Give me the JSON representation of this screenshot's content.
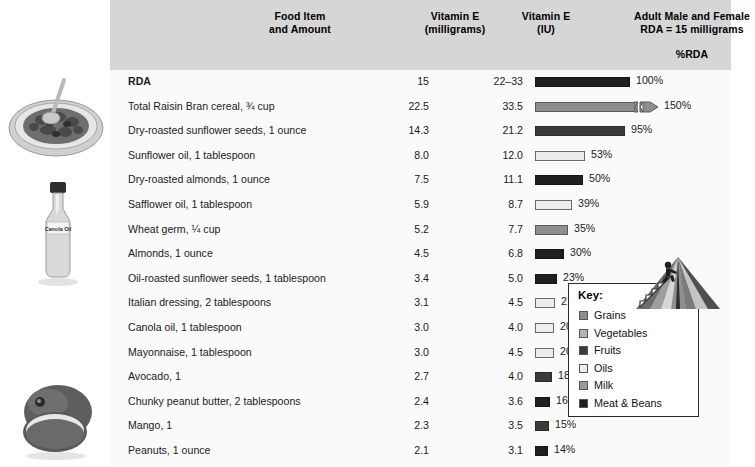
{
  "header": {
    "col_food_l1": "Food Item",
    "col_food_l2": "and Amount",
    "col_mg_l1": "Vitamin E",
    "col_mg_l2": "(milligrams)",
    "col_iu_l1": "Vitamin E",
    "col_iu_l2": "(IU)",
    "col_rda_l1": "Adult Male and Female",
    "col_rda_l2": "RDA = 15 milligrams",
    "col_pct": "%RDA"
  },
  "key": {
    "title": "Key:",
    "items": [
      {
        "label": "Grains",
        "color": "#8e8e8e"
      },
      {
        "label": "Vegetables",
        "color": "#b5b5b5"
      },
      {
        "label": "Fruits",
        "color": "#3a3a3a"
      },
      {
        "label": "Oils",
        "color": "#ededed"
      },
      {
        "label": "Milk",
        "color": "#9a9a9a"
      },
      {
        "label": "Meat & Beans",
        "color": "#1f1f1f"
      }
    ]
  },
  "illustrations": [
    {
      "name": "raisin-bran-cereal-bowl"
    },
    {
      "name": "canola-oil-bottle",
      "label": "Canola Oil"
    },
    {
      "name": "mango-fruit"
    }
  ],
  "chart_data": {
    "type": "bar",
    "title": "Adult Male and Female RDA = 15 milligrams",
    "xlabel": "%RDA",
    "ylabel": "Food Item and Amount",
    "xlim": [
      0,
      150
    ],
    "grid": false,
    "columns": [
      "Food Item and Amount",
      "Vitamin E (milligrams)",
      "Vitamin E (IU)",
      "%RDA"
    ],
    "categories": [
      "RDA",
      "Total Raisin Bran cereal, ¾ cup",
      "Dry-roasted sunflower seeds, 1 ounce",
      "Sunflower oil, 1 tablespoon",
      "Dry-roasted almonds, 1 ounce",
      "Safflower oil, 1 tablespoon",
      "Wheat germ, ¼ cup",
      "Almonds, 1 ounce",
      "Oil-roasted sunflower seeds, 1 tablespoon",
      "Italian dressing, 2 tablespoons",
      "Canola oil, 1 tablespoon",
      "Mayonnaise, 1 tablespoon",
      "Avocado, 1",
      "Chunky peanut butter, 2 tablespoons",
      "Mango, 1",
      "Peanuts, 1 ounce"
    ],
    "values": [
      100,
      150,
      95,
      53,
      50,
      39,
      35,
      30,
      23,
      21,
      20,
      20,
      18,
      16,
      15,
      14
    ],
    "rows": [
      {
        "name": "RDA",
        "mg": "15",
        "iu": "22–33",
        "pct_value": 100,
        "pct_label": "100%",
        "group": "meat",
        "bold": true,
        "broken": false
      },
      {
        "name": "Total Raisin Bran cereal, ¾ cup",
        "mg": "22.5",
        "iu": "33.5",
        "pct_value": 150,
        "pct_label": "150%",
        "group": "grains",
        "bold": false,
        "broken": true
      },
      {
        "name": "Dry-roasted sunflower seeds, 1 ounce",
        "mg": "14.3",
        "iu": "21.2",
        "pct_value": 95,
        "pct_label": "95%",
        "group": "fruits",
        "bold": false,
        "broken": false
      },
      {
        "name": "Sunflower oil, 1 tablespoon",
        "mg": "8.0",
        "iu": "12.0",
        "pct_value": 53,
        "pct_label": "53%",
        "group": "oils",
        "bold": false,
        "broken": false
      },
      {
        "name": "Dry-roasted almonds, 1 ounce",
        "mg": "7.5",
        "iu": "11.1",
        "pct_value": 50,
        "pct_label": "50%",
        "group": "meat",
        "bold": false,
        "broken": false
      },
      {
        "name": "Safflower oil, 1 tablespoon",
        "mg": "5.9",
        "iu": "8.7",
        "pct_value": 39,
        "pct_label": "39%",
        "group": "oils",
        "bold": false,
        "broken": false
      },
      {
        "name": "Wheat germ, ¼ cup",
        "mg": "5.2",
        "iu": "7.7",
        "pct_value": 35,
        "pct_label": "35%",
        "group": "grains",
        "bold": false,
        "broken": false
      },
      {
        "name": "Almonds, 1 ounce",
        "mg": "4.5",
        "iu": "6.8",
        "pct_value": 30,
        "pct_label": "30%",
        "group": "meat",
        "bold": false,
        "broken": false
      },
      {
        "name": "Oil-roasted sunflower seeds, 1 tablespoon",
        "mg": "3.4",
        "iu": "5.0",
        "pct_value": 23,
        "pct_label": "23%",
        "group": "meat",
        "bold": false,
        "broken": false
      },
      {
        "name": "Italian dressing, 2 tablespoons",
        "mg": "3.1",
        "iu": "4.5",
        "pct_value": 21,
        "pct_label": "21%",
        "group": "oils",
        "bold": false,
        "broken": false
      },
      {
        "name": "Canola oil, 1 tablespoon",
        "mg": "3.0",
        "iu": "4.0",
        "pct_value": 20,
        "pct_label": "20%",
        "group": "oils",
        "bold": false,
        "broken": false
      },
      {
        "name": "Mayonnaise, 1 tablespoon",
        "mg": "3.0",
        "iu": "4.5",
        "pct_value": 20,
        "pct_label": "20%",
        "group": "oils",
        "bold": false,
        "broken": false
      },
      {
        "name": "Avocado, 1",
        "mg": "2.7",
        "iu": "4.0",
        "pct_value": 18,
        "pct_label": "18%",
        "group": "fruits",
        "bold": false,
        "broken": false
      },
      {
        "name": "Chunky peanut butter, 2 tablespoons",
        "mg": "2.4",
        "iu": "3.6",
        "pct_value": 16,
        "pct_label": "16%",
        "group": "meat",
        "bold": false,
        "broken": false
      },
      {
        "name": "Mango, 1",
        "mg": "2.3",
        "iu": "3.5",
        "pct_value": 15,
        "pct_label": "15%",
        "group": "fruits",
        "bold": false,
        "broken": false
      },
      {
        "name": "Peanuts, 1 ounce",
        "mg": "2.1",
        "iu": "3.1",
        "pct_value": 14,
        "pct_label": "14%",
        "group": "meat",
        "bold": false,
        "broken": false
      }
    ]
  }
}
